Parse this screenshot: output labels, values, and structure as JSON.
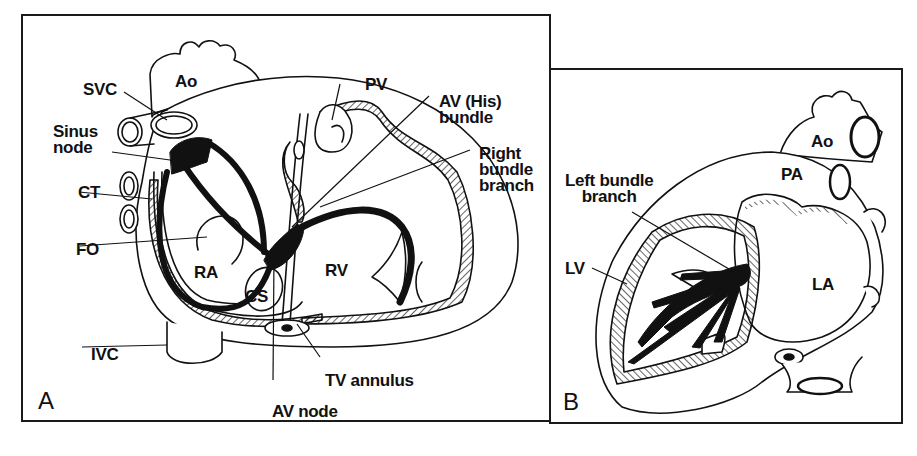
{
  "figure": {
    "panels": [
      {
        "id": "A",
        "letter": "A",
        "view": "Right heart conduction system",
        "labels": {
          "ao": "Ao",
          "svc": "SVC",
          "sinus_node": "Sinus\nnode",
          "ct": "CT",
          "fo": "FO",
          "ra": "RA",
          "cs": "CS",
          "ivc": "IVC",
          "pv": "PV",
          "his_bundle": "AV (His)\nbundle",
          "right_bundle_branch": "Right\nbundle\nbranch",
          "rv": "RV",
          "tv_annulus": "TV annulus",
          "av_node": "AV node"
        }
      },
      {
        "id": "B",
        "letter": "B",
        "view": "Left heart conduction system",
        "labels": {
          "ao": "Ao",
          "pa": "PA",
          "left_bundle_branch": "Left bundle\nbranch",
          "lv": "LV",
          "la": "LA"
        }
      }
    ],
    "colors": {
      "ink": "#111111",
      "background": "#ffffff"
    }
  }
}
